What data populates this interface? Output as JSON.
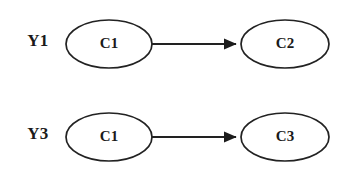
{
  "canvas": {
    "width": 344,
    "height": 178,
    "background": "#ffffff",
    "stroke_color": "#222222",
    "text_color": "#1a1a1a"
  },
  "diagram": {
    "type": "directed-graph",
    "title": "",
    "rows": [
      {
        "label": "Y1",
        "label_x": 38,
        "label_y": 41,
        "source": {
          "label": "C1",
          "cx": 109,
          "cy": 44,
          "rx": 43,
          "ry": 24
        },
        "target": {
          "label": "C2",
          "cx": 285,
          "cy": 44,
          "rx": 44,
          "ry": 24
        },
        "edge": {
          "x1": 152,
          "y1": 44,
          "x2": 241,
          "y2": 44,
          "arrowhead": "filled-triangle"
        }
      },
      {
        "label": "Y3",
        "label_x": 38,
        "label_y": 134,
        "source": {
          "label": "C1",
          "cx": 109,
          "cy": 137,
          "rx": 43,
          "ry": 24
        },
        "target": {
          "label": "C3",
          "cx": 285,
          "cy": 137,
          "rx": 44,
          "ry": 24
        },
        "edge": {
          "x1": 152,
          "y1": 137,
          "x2": 241,
          "y2": 137,
          "arrowhead": "filled-triangle"
        }
      }
    ]
  }
}
